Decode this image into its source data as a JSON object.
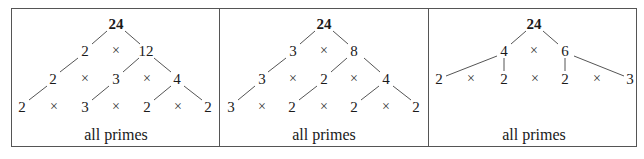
{
  "figure": {
    "times_symbol": "×",
    "line_color": "#555555",
    "panels": [
      {
        "id": "panel-1",
        "caption": "all primes",
        "caption_x": 116,
        "nodes": [
          {
            "text": "24",
            "x": 116,
            "y": 24,
            "root": true
          },
          {
            "text": "2",
            "x": 85,
            "y": 51
          },
          {
            "text": "×",
            "x": 116,
            "y": 51,
            "op": true
          },
          {
            "text": "12",
            "x": 146,
            "y": 51
          },
          {
            "text": "2",
            "x": 53,
            "y": 79
          },
          {
            "text": "×",
            "x": 85,
            "y": 79,
            "op": true
          },
          {
            "text": "3",
            "x": 116,
            "y": 79
          },
          {
            "text": "×",
            "x": 147,
            "y": 79,
            "op": true
          },
          {
            "text": "4",
            "x": 177,
            "y": 79
          },
          {
            "text": "2",
            "x": 22,
            "y": 107
          },
          {
            "text": "×",
            "x": 54,
            "y": 107,
            "op": true
          },
          {
            "text": "3",
            "x": 85,
            "y": 107
          },
          {
            "text": "×",
            "x": 116,
            "y": 107,
            "op": true
          },
          {
            "text": "2",
            "x": 147,
            "y": 107
          },
          {
            "text": "×",
            "x": 178,
            "y": 107,
            "op": true
          },
          {
            "text": "2",
            "x": 208,
            "y": 107
          }
        ],
        "edges": [
          [
            107,
            31,
            92,
            44
          ],
          [
            125,
            31,
            140,
            44
          ],
          [
            78,
            58,
            60,
            72
          ],
          [
            139,
            58,
            123,
            72
          ],
          [
            154,
            58,
            171,
            72
          ],
          [
            47,
            86,
            29,
            100
          ],
          [
            109,
            86,
            92,
            100
          ],
          [
            171,
            86,
            154,
            100
          ],
          [
            184,
            86,
            202,
            100
          ]
        ]
      },
      {
        "id": "panel-2",
        "caption": "all primes",
        "caption_x": 324,
        "nodes": [
          {
            "text": "24",
            "x": 324,
            "y": 24,
            "root": true
          },
          {
            "text": "3",
            "x": 293,
            "y": 51
          },
          {
            "text": "×",
            "x": 324,
            "y": 51,
            "op": true
          },
          {
            "text": "8",
            "x": 354,
            "y": 51
          },
          {
            "text": "3",
            "x": 262,
            "y": 79
          },
          {
            "text": "×",
            "x": 293,
            "y": 79,
            "op": true
          },
          {
            "text": "2",
            "x": 324,
            "y": 79
          },
          {
            "text": "×",
            "x": 354,
            "y": 79,
            "op": true
          },
          {
            "text": "4",
            "x": 386,
            "y": 79
          },
          {
            "text": "3",
            "x": 231,
            "y": 107
          },
          {
            "text": "×",
            "x": 262,
            "y": 107,
            "op": true
          },
          {
            "text": "2",
            "x": 292,
            "y": 107
          },
          {
            "text": "×",
            "x": 324,
            "y": 107,
            "op": true
          },
          {
            "text": "2",
            "x": 354,
            "y": 107
          },
          {
            "text": "×",
            "x": 386,
            "y": 107,
            "op": true
          },
          {
            "text": "2",
            "x": 416,
            "y": 107
          }
        ],
        "edges": [
          [
            315,
            31,
            300,
            44
          ],
          [
            333,
            31,
            348,
            44
          ],
          [
            286,
            58,
            268,
            72
          ],
          [
            347,
            58,
            331,
            72
          ],
          [
            364,
            58,
            380,
            72
          ],
          [
            255,
            86,
            238,
            100
          ],
          [
            317,
            86,
            299,
            100
          ],
          [
            379,
            86,
            361,
            100
          ],
          [
            393,
            86,
            411,
            100
          ]
        ]
      },
      {
        "id": "panel-3",
        "caption": "all primes",
        "caption_x": 534,
        "nodes": [
          {
            "text": "24",
            "x": 534,
            "y": 24,
            "root": true
          },
          {
            "text": "4",
            "x": 504,
            "y": 51
          },
          {
            "text": "×",
            "x": 534,
            "y": 51,
            "op": true
          },
          {
            "text": "6",
            "x": 565,
            "y": 51
          },
          {
            "text": "2",
            "x": 439,
            "y": 79
          },
          {
            "text": "×",
            "x": 471,
            "y": 79,
            "op": true
          },
          {
            "text": "2",
            "x": 504,
            "y": 79
          },
          {
            "text": "×",
            "x": 535,
            "y": 79,
            "op": true
          },
          {
            "text": "2",
            "x": 565,
            "y": 79
          },
          {
            "text": "×",
            "x": 597,
            "y": 79,
            "op": true
          },
          {
            "text": "3",
            "x": 630,
            "y": 79
          }
        ],
        "edges": [
          [
            526,
            31,
            511,
            44
          ],
          [
            543,
            31,
            558,
            44
          ],
          [
            497,
            56,
            446,
            76
          ],
          [
            504,
            58,
            504,
            71
          ],
          [
            565,
            58,
            565,
            71
          ],
          [
            574,
            56,
            624,
            76
          ]
        ]
      }
    ]
  }
}
